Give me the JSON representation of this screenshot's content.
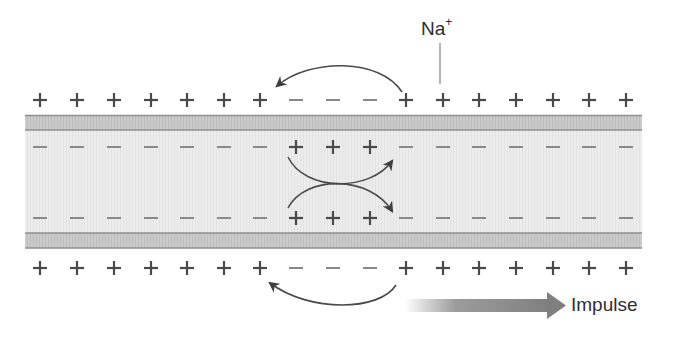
{
  "diagram": {
    "colors": {
      "charge": "#4a4a4a",
      "minus_charge": "#8a8a8a",
      "membrane_fill": "#c8c8c8",
      "membrane_edge": "#8c8c8c",
      "axoplasm_fill": "#ececec",
      "arrow": "#4a4a4a",
      "impulse_arrow": "#8a8a8a"
    },
    "charge_positions_x": [
      40,
      77,
      114,
      151,
      187,
      224,
      260,
      296,
      333,
      370,
      406,
      443,
      479,
      516,
      553,
      589,
      626
    ],
    "rows": [
      {
        "name": "outer-top-charges",
        "y": 100,
        "charges": [
          "+",
          "+",
          "+",
          "+",
          "+",
          "+",
          "+",
          "−",
          "−",
          "−",
          "+",
          "+",
          "+",
          "+",
          "+",
          "+",
          "+"
        ]
      },
      {
        "name": "inner-top-charges",
        "y": 147,
        "charges": [
          "−",
          "−",
          "−",
          "−",
          "−",
          "−",
          "−",
          "+",
          "+",
          "+",
          "−",
          "−",
          "−",
          "−",
          "−",
          "−",
          "−"
        ]
      },
      {
        "name": "inner-bottom-charges",
        "y": 218,
        "charges": [
          "−",
          "−",
          "−",
          "−",
          "−",
          "−",
          "−",
          "+",
          "+",
          "+",
          "−",
          "−",
          "−",
          "−",
          "−",
          "−",
          "−"
        ]
      },
      {
        "name": "outer-bottom-charges",
        "y": 268,
        "charges": [
          "+",
          "+",
          "+",
          "+",
          "+",
          "+",
          "+",
          "−",
          "−",
          "−",
          "+",
          "+",
          "+",
          "+",
          "+",
          "+",
          "+"
        ]
      }
    ],
    "labels": {
      "ion": "Na",
      "ion_charge": "+",
      "direction": "Impulse"
    }
  }
}
